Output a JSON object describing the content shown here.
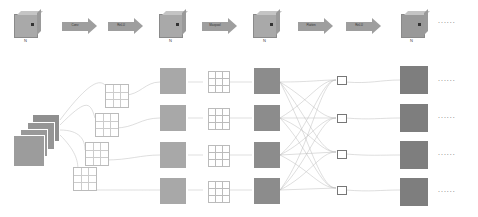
{
  "top_row": {
    "cubes": [
      {
        "x": 14,
        "label": "N",
        "marker": "N"
      },
      {
        "x": 159,
        "label": "N",
        "marker": "N"
      },
      {
        "x": 253,
        "label": "N",
        "marker": "N"
      },
      {
        "x": 407,
        "label": "N",
        "marker": "N"
      }
    ],
    "arrows": [
      {
        "x": 62,
        "label": "Conv"
      },
      {
        "x": 108,
        "label": "ReLU"
      },
      {
        "x": 202,
        "label": "Maxpool"
      },
      {
        "x": 298,
        "label": "Flatten"
      },
      {
        "x": 346,
        "label": "ReLU"
      }
    ],
    "ellipsis": "......"
  },
  "bottom": {
    "input_stack_count": 4,
    "kernels_count": 4,
    "rows": 4,
    "ellipsis": "......"
  }
}
